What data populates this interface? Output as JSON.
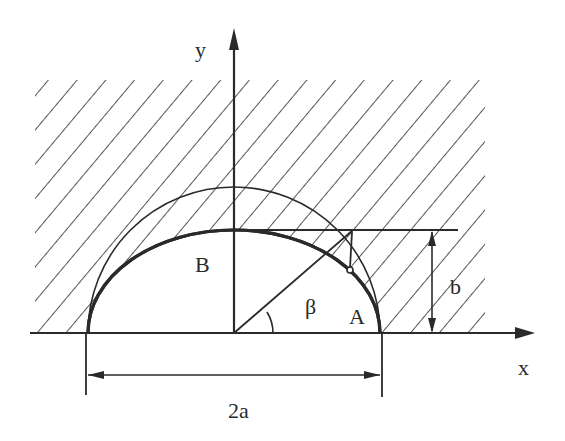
{
  "diagram": {
    "title": "",
    "axes": {
      "x_label": "x",
      "y_label": "y"
    },
    "labels": {
      "point_a": "A",
      "point_b": "B",
      "angle": "β",
      "semi_minor": "b",
      "major_width": "2a"
    },
    "shapes": {
      "ellipse": "upper half-ellipse with semi-axes a (horizontal) and b (vertical), drawn bold",
      "circle": "auxiliary semicircle of radius a, drawn thin",
      "hatched_region": "region above x-axis outside the ellipse, hatched with diagonal lines",
      "construction": "ray from origin at angle β to the auxiliary circle, vertical drop to ellipse point, horizontal tangent line at y=b"
    },
    "colors": {
      "ink": "#2a2a2a",
      "background": "#ffffff"
    }
  }
}
